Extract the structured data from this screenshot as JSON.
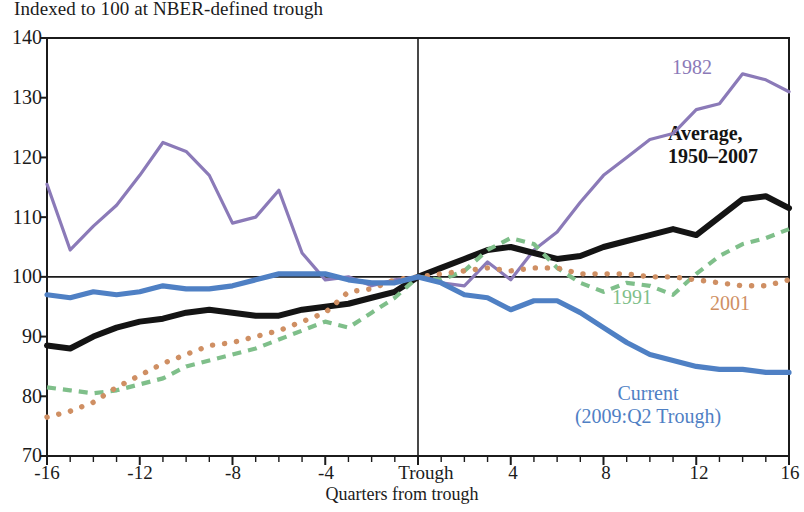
{
  "subtitle": "Indexed to 100 at NBER-defined trough",
  "axis": {
    "x_title": "Quarters from trough",
    "y_ticks": [
      "140",
      "130",
      "120",
      "110",
      "100",
      "90",
      "80",
      "70"
    ],
    "x_ticks": [
      "-16",
      "-12",
      "-8",
      "-4",
      "Trough",
      "4",
      "8",
      "12",
      "16"
    ]
  },
  "labels": {
    "l1982": "1982",
    "average_line1": "Average,",
    "average_line2": "1950–2007",
    "l1991": "1991",
    "l2001": "2001",
    "current_line1": "Current",
    "current_line2": "(2009:Q2 Trough)"
  },
  "colors": {
    "purple_1982": "#8b7ab8",
    "black_average": "#141414",
    "green_1991": "#7fbf8a",
    "orange_2001": "#cf8f63",
    "blue_current": "#4f80c4",
    "axis": "#1b1b1b"
  },
  "chart_data": {
    "type": "line",
    "title": "",
    "subtitle": "Indexed to 100 at NBER-defined trough",
    "xlabel": "Quarters from trough",
    "ylabel": "",
    "xlim": [
      -16,
      16
    ],
    "ylim": [
      70,
      140
    ],
    "grid": false,
    "legend": "inline-annotations",
    "reference_lines": {
      "horizontal": [
        100
      ],
      "vertical": [
        0
      ]
    },
    "x": [
      -16,
      -15,
      -14,
      -13,
      -12,
      -11,
      -10,
      -9,
      -8,
      -7,
      -6,
      -5,
      -4,
      -3,
      -2,
      -1,
      0,
      1,
      2,
      3,
      4,
      5,
      6,
      7,
      8,
      9,
      10,
      11,
      12,
      13,
      14,
      15,
      16
    ],
    "series": [
      {
        "name": "1982",
        "color": "#8b7ab8",
        "style": "solid",
        "values": [
          115.5,
          104.5,
          108.5,
          112.0,
          117.0,
          122.5,
          121.0,
          117.0,
          109.0,
          110.0,
          114.5,
          104.0,
          99.5,
          100.0,
          98.5,
          99.5,
          100.0,
          99.0,
          98.5,
          102.5,
          99.5,
          104.5,
          107.5,
          112.5,
          117.0,
          120.0,
          123.0,
          124.0,
          128.0,
          129.0,
          134.0,
          133.0,
          131.0
        ]
      },
      {
        "name": "Average, 1950-2007",
        "color": "#141414",
        "style": "solid-bold",
        "values": [
          88.5,
          88.0,
          90.0,
          91.5,
          92.5,
          93.0,
          94.0,
          94.5,
          94.0,
          93.5,
          93.5,
          94.5,
          95.0,
          95.5,
          96.5,
          97.5,
          100.0,
          101.5,
          103.0,
          104.5,
          105.0,
          104.0,
          103.0,
          103.5,
          105.0,
          106.0,
          107.0,
          108.0,
          107.0,
          110.0,
          113.0,
          113.5,
          111.5
        ]
      },
      {
        "name": "1991",
        "color": "#7fbf8a",
        "style": "dashed",
        "values": [
          81.5,
          81.0,
          80.5,
          81.0,
          82.0,
          83.0,
          85.0,
          86.0,
          87.0,
          88.0,
          89.5,
          91.0,
          92.5,
          91.5,
          94.0,
          96.5,
          100.0,
          99.5,
          101.0,
          104.5,
          106.5,
          105.5,
          101.5,
          99.0,
          97.5,
          99.0,
          98.5,
          97.0,
          100.5,
          103.5,
          105.5,
          106.5,
          108.0
        ]
      },
      {
        "name": "2001",
        "color": "#cf8f63",
        "style": "dotted",
        "values": [
          76.5,
          77.5,
          79.0,
          81.5,
          83.5,
          85.5,
          87.0,
          88.5,
          89.0,
          90.0,
          91.0,
          92.5,
          94.0,
          97.5,
          98.0,
          99.5,
          100.0,
          100.5,
          101.0,
          101.5,
          101.0,
          101.5,
          101.5,
          100.5,
          100.5,
          100.5,
          100.0,
          100.0,
          99.5,
          99.0,
          98.5,
          98.5,
          99.5
        ]
      },
      {
        "name": "Current (2009:Q2 Trough)",
        "color": "#4f80c4",
        "style": "solid-thick",
        "values": [
          97.0,
          96.5,
          97.5,
          97.0,
          97.5,
          98.5,
          98.0,
          98.0,
          98.5,
          99.5,
          100.5,
          100.5,
          100.5,
          99.5,
          99.0,
          99.0,
          100.0,
          99.0,
          97.0,
          96.5,
          94.5,
          96.0,
          96.0,
          94.0,
          91.5,
          89.0,
          87.0,
          86.0,
          85.0,
          84.5,
          84.5,
          84.0,
          84.0
        ]
      }
    ]
  }
}
